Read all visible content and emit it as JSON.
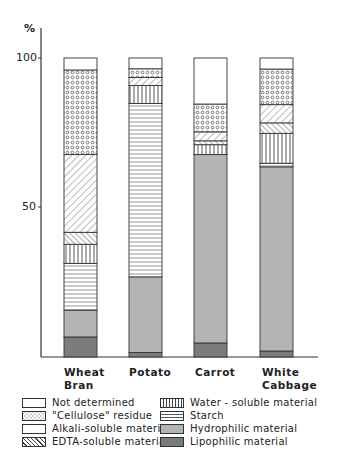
{
  "chart_data": {
    "type": "bar",
    "stacked": true,
    "title": "",
    "ylabel": "%",
    "xlabel": "",
    "ylim": [
      0,
      100
    ],
    "yticks": [
      50,
      100
    ],
    "grid": false,
    "legend_position": "bottom",
    "categories": [
      "Wheat Bran",
      "Potato",
      "Carrot",
      "White Cabbage"
    ],
    "category_lines": [
      [
        "Wheat",
        "Bran"
      ],
      [
        "Potato"
      ],
      [
        "Carrot"
      ],
      [
        "White",
        "Cabbage"
      ]
    ],
    "series": [
      {
        "name": "Lipophilic material",
        "pattern": "dark-gray",
        "values": [
          6.7,
          1.5,
          4.7,
          2.0
        ]
      },
      {
        "name": "Hydrophilic material",
        "pattern": "light-gray",
        "values": [
          9.0,
          25.3,
          63.0,
          61.6
        ]
      },
      {
        "name": "Starch",
        "pattern": "horizontal-lines",
        "values": [
          15.6,
          58.0,
          0.0,
          1.2
        ]
      },
      {
        "name": "Water-soluble material",
        "pattern": "vertical-lines",
        "values": [
          6.4,
          6.0,
          3.3,
          10.0
        ]
      },
      {
        "name": "EDTA-soluble material",
        "pattern": "back-diagonal",
        "values": [
          4.0,
          0.0,
          1.3,
          3.5
        ]
      },
      {
        "name": "Alkali-soluble material",
        "pattern": "forward-diagonal",
        "values": [
          26.0,
          2.7,
          3.0,
          6.1
        ]
      },
      {
        "name": "\"Cellulose\" residue",
        "pattern": "dots",
        "values": [
          28.3,
          2.9,
          9.3,
          11.9
        ]
      },
      {
        "name": "Not determined",
        "pattern": "blank",
        "values": [
          4.0,
          3.6,
          15.4,
          3.7
        ]
      }
    ]
  },
  "axis": {
    "unit_label": "%",
    "tick_100": "100",
    "tick_50": "50"
  },
  "legend": {
    "left": [
      {
        "label": "Not determined",
        "pattern": "blank"
      },
      {
        "label": "\"Cellulose\" residue",
        "pattern": "dots"
      },
      {
        "label": "Alkali-soluble material",
        "pattern": "blank"
      },
      {
        "label": "EDTA-soluble material",
        "pattern": "back-diagonal"
      }
    ],
    "right": [
      {
        "label": "Water - soluble material",
        "pattern": "vertical-lines"
      },
      {
        "label": "Starch",
        "pattern": "horizontal-lines"
      },
      {
        "label": "Hydrophilic material",
        "pattern": "light-gray"
      },
      {
        "label": "Lipophilic material",
        "pattern": "dark-gray"
      }
    ]
  },
  "colors": {
    "light_gray": "#b4b4b4",
    "dark_gray": "#7c7c7c",
    "ink": "#333333"
  }
}
